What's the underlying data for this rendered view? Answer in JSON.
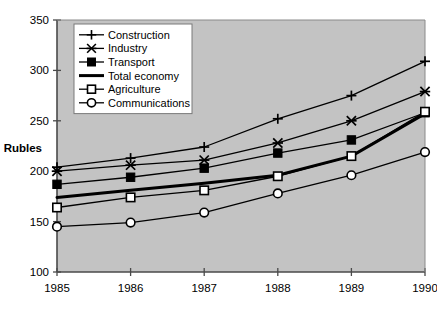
{
  "chart_data": {
    "type": "line",
    "title": "",
    "xlabel": "",
    "ylabel": "Rubles",
    "categories": [
      "1985",
      "1986",
      "1987",
      "1988",
      "1989",
      "1990"
    ],
    "x": [
      1985,
      1986,
      1987,
      1988,
      1989,
      1990
    ],
    "xlim": [
      1985,
      1990
    ],
    "ylim": [
      100,
      350
    ],
    "yticks": [
      100,
      150,
      200,
      250,
      300,
      350
    ],
    "ytick_labels": [
      "100",
      "150",
      "200",
      "250",
      "300",
      "350"
    ],
    "xticks": [
      1985,
      1986,
      1987,
      1988,
      1989,
      1990
    ],
    "grid": false,
    "legend_position": "top-left-inside",
    "plot_background": "#c3c3c3",
    "figure_background": "#ffffff",
    "series": [
      {
        "name": "Construction",
        "marker": "plus",
        "values": [
          204,
          213,
          224,
          252,
          275,
          309
        ]
      },
      {
        "name": "Industry",
        "marker": "asterisk",
        "values": [
          200,
          206,
          211,
          228,
          250,
          279
        ]
      },
      {
        "name": "Transport",
        "marker": "filled-square",
        "values": [
          187,
          194,
          203,
          218,
          231,
          258
        ]
      },
      {
        "name": "Total economy",
        "marker": "none",
        "values": [
          174,
          181,
          188,
          196,
          215,
          257
        ]
      },
      {
        "name": "Agriculture",
        "marker": "open-square",
        "values": [
          164,
          174,
          181,
          195,
          215,
          259
        ]
      },
      {
        "name": "Communications",
        "marker": "open-circle",
        "values": [
          145,
          149,
          159,
          178,
          196,
          219
        ]
      }
    ]
  },
  "legend": {
    "entries": [
      {
        "label": "Construction",
        "marker": "plus"
      },
      {
        "label": "Industry",
        "marker": "asterisk"
      },
      {
        "label": "Transport",
        "marker": "filled-square"
      },
      {
        "label": "Total economy",
        "marker": "none"
      },
      {
        "label": "Agriculture",
        "marker": "open-square"
      },
      {
        "label": "Communications",
        "marker": "open-circle"
      }
    ]
  },
  "colors": {
    "line": "#000000",
    "plot_area": "#c3c3c3",
    "axis": "#000000",
    "legend_background": "#ffffff"
  }
}
